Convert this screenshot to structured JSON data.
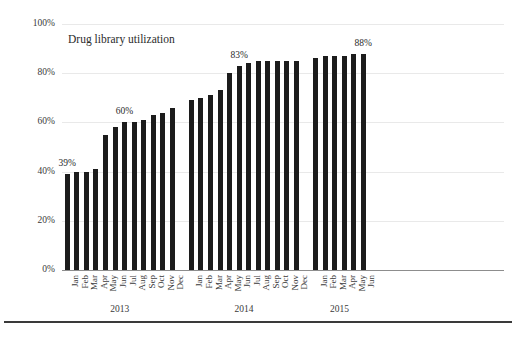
{
  "chart_data": {
    "type": "bar",
    "title": "Drug library utilization",
    "xlabel": "",
    "ylabel": "",
    "ylim": [
      0,
      100
    ],
    "yticks": [
      "0%",
      "20%",
      "40%",
      "60%",
      "80%",
      "100%"
    ],
    "ytick_values": [
      0,
      20,
      40,
      60,
      80,
      100
    ],
    "grid": true,
    "legend": null,
    "unit": "%",
    "bar_color": "#1c1c1c",
    "groups": [
      {
        "year": "2013",
        "categories": [
          "Jan",
          "Feb",
          "Mar",
          "Apr",
          "May",
          "Jun",
          "Jul",
          "Aug",
          "Sep",
          "Oct",
          "Nov",
          "Dec"
        ],
        "values": [
          39,
          40,
          40,
          41,
          55,
          58,
          60,
          60,
          61,
          63,
          64,
          66
        ]
      },
      {
        "year": "2014",
        "categories": [
          "Jan",
          "Feb",
          "Mar",
          "Apr",
          "May",
          "Jun",
          "Jul",
          "Aug",
          "Sep",
          "Oct",
          "Nov",
          "Dec"
        ],
        "values": [
          69,
          70,
          71,
          73,
          80,
          83,
          84,
          85,
          85,
          85,
          85,
          85
        ]
      },
      {
        "year": "2015",
        "categories": [
          "Jan",
          "Feb",
          "Mar",
          "Apr",
          "May",
          "Jun"
        ],
        "values": [
          86,
          87,
          87,
          87,
          88,
          88
        ]
      }
    ],
    "annotations": [
      {
        "text": "39%",
        "group": 0,
        "index": 0,
        "value": 39
      },
      {
        "text": "60%",
        "group": 0,
        "index": 6,
        "value": 60
      },
      {
        "text": "83%",
        "group": 1,
        "index": 5,
        "value": 83
      },
      {
        "text": "88%",
        "group": 2,
        "index": 5,
        "value": 88
      }
    ]
  }
}
